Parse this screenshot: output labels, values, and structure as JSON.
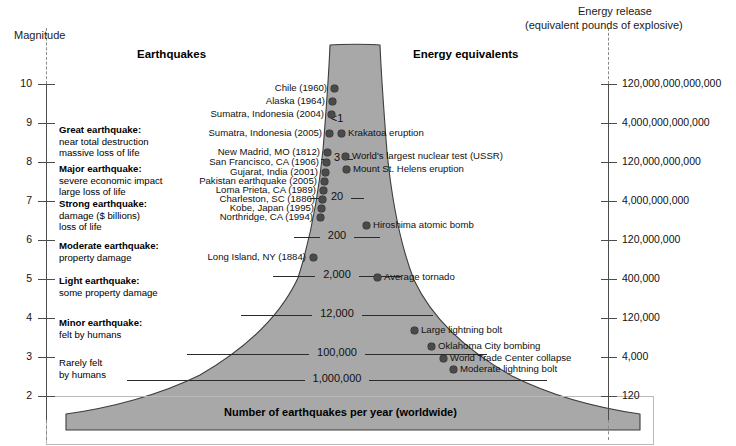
{
  "chart_data": {
    "type": "area",
    "left_axis": {
      "label": "Magnitude",
      "ticks": [
        10,
        9,
        8,
        7,
        6,
        5,
        4,
        3,
        2
      ],
      "ylim": [
        2,
        10
      ]
    },
    "right_axis": {
      "label_line1": "Energy release",
      "label_line2": "(equivalent pounds of explosive)",
      "ticks": [
        "120,000,000,000,000",
        "4,000,000,000,000",
        "120,000,000,000",
        "4,000,000,000",
        "120,000,000",
        "400,000",
        "120,000",
        "4,000",
        "120"
      ],
      "tick_magnitudes": [
        10,
        9,
        8,
        7,
        6,
        5,
        4,
        3,
        2
      ]
    },
    "columns": {
      "earthquakes_header": "Earthquakes",
      "energy_header": "Energy equivalents"
    },
    "frequency_label": "Number of earthquakes per year (worldwide)",
    "frequency_bands": [
      {
        "count": "<1",
        "magnitude": 8.9,
        "y": 120
      },
      {
        "count": "3",
        "magnitude": 7.9,
        "y": 159
      },
      {
        "count": "20",
        "magnitude": 6.9,
        "y": 198
      },
      {
        "count": "200",
        "magnitude": 5.9,
        "y": 237
      },
      {
        "count": "2,000",
        "magnitude": 4.9,
        "y": 276
      },
      {
        "count": "12,000",
        "magnitude": 3.9,
        "y": 315
      },
      {
        "count": "100,000",
        "magnitude": 2.9,
        "y": 354
      },
      {
        "count": "1,000,000",
        "magnitude": 1.9,
        "y": 380
      }
    ],
    "earthquake_events": [
      {
        "name": "Chile (1960)",
        "magnitude": 9.5,
        "x": 334,
        "y": 88
      },
      {
        "name": "Alaska (1964)",
        "magnitude": 9.2,
        "x": 332,
        "y": 101
      },
      {
        "name": "Sumatra, Indonesia (2004)",
        "magnitude": 9.1,
        "x": 331,
        "y": 114
      },
      {
        "name": "Sumatra, Indonesia (2005)",
        "magnitude": 8.6,
        "x": 329,
        "y": 133
      },
      {
        "name": "New Madrid, MO (1812)",
        "magnitude": 8.1,
        "x": 327,
        "y": 152
      },
      {
        "name": "San Francisco, CA (1906)",
        "magnitude": 7.9,
        "x": 326,
        "y": 162
      },
      {
        "name": "Gujarat, India (2001)",
        "magnitude": 7.7,
        "x": 325,
        "y": 172
      },
      {
        "name": "Pakistan earthquake (2005)",
        "magnitude": 7.6,
        "x": 324,
        "y": 181
      },
      {
        "name": "Loma Prieta, CA (1989)",
        "magnitude": 7.0,
        "x": 323,
        "y": 190
      },
      {
        "name": "Charleston, SC (1886)",
        "magnitude": 6.9,
        "x": 322,
        "y": 199
      },
      {
        "name": "Kobe, Japan (1995)",
        "magnitude": 6.8,
        "x": 321,
        "y": 208
      },
      {
        "name": "Northridge, CA (1994)",
        "magnitude": 6.7,
        "x": 320,
        "y": 217
      },
      {
        "name": "Long Island, NY (1884)",
        "magnitude": 5.2,
        "x": 313,
        "y": 257
      }
    ],
    "energy_events": [
      {
        "name": "Krakatoa eruption",
        "magnitude": 8.7,
        "x": 341,
        "y": 133
      },
      {
        "name": "World's largest nuclear test (USSR)",
        "magnitude": 8.0,
        "x": 345,
        "y": 156
      },
      {
        "name": "Mount St. Helens eruption",
        "magnitude": 7.8,
        "x": 346,
        "y": 169
      },
      {
        "name": "Hiroshima atomic bomb",
        "magnitude": 6.2,
        "x": 366,
        "y": 225
      },
      {
        "name": "Average tornado",
        "magnitude": 5.0,
        "x": 377,
        "y": 277
      },
      {
        "name": "Large lightning bolt",
        "magnitude": 3.6,
        "x": 414,
        "y": 330
      },
      {
        "name": "Oklahoma City bombing",
        "magnitude": 3.2,
        "x": 431,
        "y": 346
      },
      {
        "name": "World Trade Center collapse",
        "magnitude": 2.9,
        "x": 443,
        "y": 358
      },
      {
        "name": "Moderate lightning bolt",
        "magnitude": 2.7,
        "x": 453,
        "y": 369
      }
    ],
    "severity_classes": [
      {
        "title": "Great earthquake:",
        "lines": [
          "near total destruction",
          "massive loss of life"
        ],
        "y": 124
      },
      {
        "title": "Major earthquake:",
        "lines": [
          "severe economic impact",
          "large loss of life"
        ],
        "y": 163
      },
      {
        "title": "Strong earthquake:",
        "lines": [
          "damage ($ billions)",
          "loss of life"
        ],
        "y": 198
      },
      {
        "title": "Moderate earthquake:",
        "lines": [
          "property damage"
        ],
        "y": 240
      },
      {
        "title": "Light earthquake:",
        "lines": [
          "some property damage"
        ],
        "y": 275
      },
      {
        "title": "Minor earthquake:",
        "lines": [
          "felt by humans"
        ],
        "y": 317
      },
      {
        "title": "",
        "lines": [
          "Rarely felt",
          "by humans"
        ],
        "y": 357
      }
    ],
    "colors": {
      "funnel_fill": "#a8a8a8",
      "funnel_stroke": "#3d3d3d",
      "axis": "#4d4d4d",
      "dot": "#4a4a4a",
      "text": "#111111"
    }
  }
}
